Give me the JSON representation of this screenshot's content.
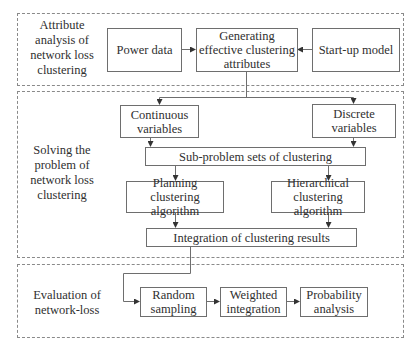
{
  "diagram": {
    "type": "flowchart",
    "sections": [
      {
        "id": "attribute-analysis",
        "label": "Attribute\nanalysis of\nnetwork loss\nclustering",
        "label_lines": [
          "Attribute",
          "analysis of",
          "network loss",
          "clustering"
        ]
      },
      {
        "id": "solving-problem",
        "label": "Solving the\nproblem of\nnetwork loss\nclustering",
        "label_lines": [
          "Solving the",
          "problem of",
          "network loss",
          "clustering"
        ]
      },
      {
        "id": "evaluation",
        "label": "Evaluation of\nnetwork-loss",
        "label_lines": [
          "Evaluation of",
          "network-loss"
        ]
      }
    ],
    "nodes": {
      "power_data": {
        "lines": [
          "Power data"
        ]
      },
      "generating": {
        "lines": [
          "Generating",
          "effective clustering",
          "attributes"
        ]
      },
      "startup_model": {
        "lines": [
          "Start-up model"
        ]
      },
      "continuous": {
        "lines": [
          "Continuous",
          "variables"
        ]
      },
      "discrete": {
        "lines": [
          "Discrete",
          "variables"
        ]
      },
      "subproblem": {
        "lines": [
          "Sub-problem sets of clustering"
        ]
      },
      "planning": {
        "lines": [
          "Planning clustering",
          "algorithm"
        ]
      },
      "hierarchical": {
        "lines": [
          "Hierarchical",
          "clustering algorithm"
        ]
      },
      "integration": {
        "lines": [
          "Integration of clustering results"
        ]
      },
      "random_sampling": {
        "lines": [
          "Random",
          "sampling"
        ]
      },
      "weighted_integration": {
        "lines": [
          "Weighted",
          "integration"
        ]
      },
      "probability_analysis": {
        "lines": [
          "Probability",
          "analysis"
        ]
      }
    },
    "edges": [
      {
        "from": "Power data",
        "to": "Generating effective clustering attributes"
      },
      {
        "from": "Start-up model",
        "to": "Generating effective clustering attributes"
      },
      {
        "from": "Generating effective clustering attributes",
        "to": "Continuous variables"
      },
      {
        "from": "Generating effective clustering attributes",
        "to": "Discrete variables"
      },
      {
        "from": "Continuous variables",
        "to": "Sub-problem sets of clustering"
      },
      {
        "from": "Discrete variables",
        "to": "Sub-problem sets of clustering"
      },
      {
        "from": "Sub-problem sets of clustering",
        "to": "Planning clustering algorithm"
      },
      {
        "from": "Sub-problem sets of clustering",
        "to": "Hierarchical clustering algorithm"
      },
      {
        "from": "Planning clustering algorithm",
        "to": "Integration of clustering results"
      },
      {
        "from": "Hierarchical clustering algorithm",
        "to": "Integration of clustering results"
      },
      {
        "from": "Integration of clustering results",
        "to": "Random sampling"
      },
      {
        "from": "Random sampling",
        "to": "Weighted integration"
      },
      {
        "from": "Weighted integration",
        "to": "Probability analysis"
      }
    ],
    "colors": {
      "line": "#6e6e6e",
      "dashed_border": "#8a8a8a",
      "text": "#2f2f2f",
      "background": "#ffffff"
    }
  }
}
